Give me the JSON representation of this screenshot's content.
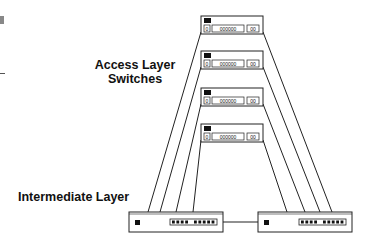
{
  "labels": {
    "access_line1": "Access Layer",
    "access_line2": "Switches",
    "intermediate": "Intermediate Layer"
  },
  "access_switches": [
    {
      "x": 201,
      "y": 16,
      "w": 62,
      "h": 18,
      "ports_small": "0",
      "ports_mid": "000000",
      "ports_right": "00"
    },
    {
      "x": 201,
      "y": 51,
      "w": 62,
      "h": 18,
      "ports_small": "0",
      "ports_mid": "000000",
      "ports_right": "00"
    },
    {
      "x": 201,
      "y": 88,
      "w": 62,
      "h": 18,
      "ports_small": "0",
      "ports_mid": "000000",
      "ports_right": "00"
    },
    {
      "x": 201,
      "y": 124,
      "w": 62,
      "h": 18,
      "ports_small": "0",
      "ports_mid": "000000",
      "ports_right": "00"
    }
  ],
  "intermediate_switches": [
    {
      "x": 129,
      "y": 212,
      "w": 94,
      "h": 20
    },
    {
      "x": 258,
      "y": 212,
      "w": 94,
      "h": 20
    }
  ],
  "uplinks_left_x": [
    148,
    160,
    176,
    193
  ],
  "uplinks_right_x": [
    332,
    320,
    305,
    287
  ],
  "colors": {
    "line": "#222222",
    "fill": "#ffffff",
    "port": "#111111"
  }
}
